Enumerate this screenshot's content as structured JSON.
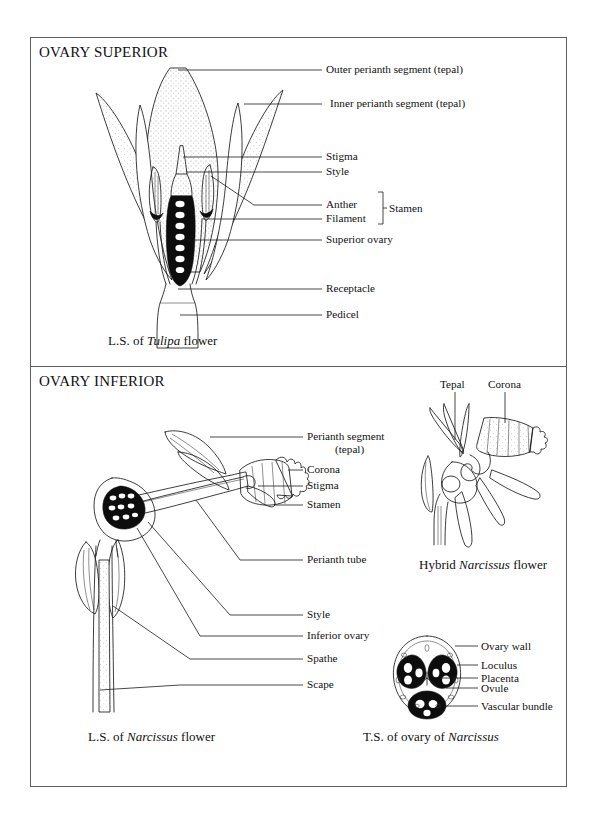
{
  "figure": {
    "panels": [
      {
        "id": "superior",
        "title": "OVARY SUPERIOR",
        "caption_prefix": "L.S. of ",
        "caption_italic": "Tulipa",
        "caption_suffix": " flower",
        "labels": [
          "Outer perianth segment (tepal)",
          "Inner perianth segment (tepal)",
          "Stigma",
          "Style",
          "Anther",
          "Filament",
          "Superior ovary",
          "Receptacle",
          "Pedicel"
        ],
        "bracket_label": "Stamen"
      },
      {
        "id": "inferior",
        "title": "OVARY INFERIOR",
        "labels": [
          "Perianth segment",
          "(tepal)",
          "Corona",
          "Stigma",
          "Stamen",
          "Perianth tube",
          "Style",
          "Inferior ovary",
          "Spathe",
          "Scape"
        ],
        "captions": [
          {
            "prefix": "L.S. of ",
            "italic": "Narcissus",
            "suffix": " flower"
          },
          {
            "prefix": "Hybrid ",
            "italic": "Narcissus",
            "suffix": " flower"
          },
          {
            "prefix": "T.S. of ovary of ",
            "italic": "Narcissus",
            "suffix": ""
          }
        ],
        "hybrid_labels": [
          "Tepal",
          "Corona"
        ],
        "ts_labels": [
          "Ovary wall",
          "Loculus",
          "Placenta",
          "Ovule",
          "Vascular bundle"
        ]
      }
    ],
    "colors": {
      "ink": "#1a1a1a",
      "frame": "#5d5d5d",
      "paper": "#ffffff",
      "solid_fill": "#0d0d0d"
    }
  }
}
